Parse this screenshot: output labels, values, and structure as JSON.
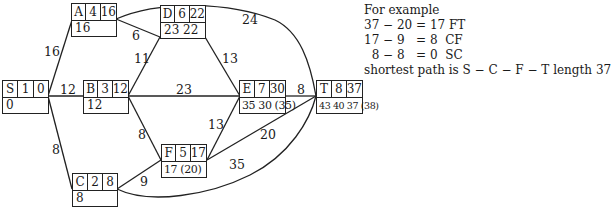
{
  "nodes": {
    "S": {
      "name": "S",
      "duration": "1",
      "value": "0",
      "bottom": "0"
    },
    "A": {
      "name": "A",
      "duration": "4",
      "value": "16",
      "bottom": "16"
    },
    "B": {
      "name": "B",
      "duration": "3",
      "value": "12",
      "bottom": "12"
    },
    "C": {
      "name": "C",
      "duration": "2",
      "value": "8",
      "bottom": "8"
    },
    "D": {
      "name": "D",
      "duration": "6",
      "value": "22",
      "bottom": "23 22"
    },
    "E": {
      "name": "E",
      "duration": "7",
      "value": "30",
      "bottom": "35 30 (35)"
    },
    "F": {
      "name": "F",
      "duration": "5",
      "value": "17",
      "bottom": "17 (20)"
    },
    "T": {
      "name": "T",
      "duration": "8",
      "value": "37",
      "bottom": "43 40 37 (38)"
    }
  },
  "edges": [
    {
      "from": "S",
      "to": "A",
      "weight": "16"
    },
    {
      "from": "S",
      "to": "B",
      "weight": "12"
    },
    {
      "from": "S",
      "to": "C",
      "weight": "8"
    },
    {
      "from": "A",
      "to": "D",
      "weight": "6"
    },
    {
      "from": "A",
      "to": "T",
      "weight": "24"
    },
    {
      "from": "B",
      "to": "D",
      "weight": "11"
    },
    {
      "from": "B",
      "to": "E",
      "weight": "23"
    },
    {
      "from": "B",
      "to": "F",
      "weight": "8"
    },
    {
      "from": "C",
      "to": "F",
      "weight": "9"
    },
    {
      "from": "C",
      "to": "T",
      "weight": "35"
    },
    {
      "from": "D",
      "to": "E",
      "weight": "13"
    },
    {
      "from": "F",
      "to": "E",
      "weight": "13"
    },
    {
      "from": "F",
      "to": "T",
      "weight": "20"
    },
    {
      "from": "E",
      "to": "T",
      "weight": "8"
    }
  ],
  "notes": [
    "For example",
    "37 − 20 = 17 FT",
    "17 − 9   = 8  CF",
    "  8 − 8   = 0  SC",
    "shortest path is S − C − F − T length 37"
  ]
}
